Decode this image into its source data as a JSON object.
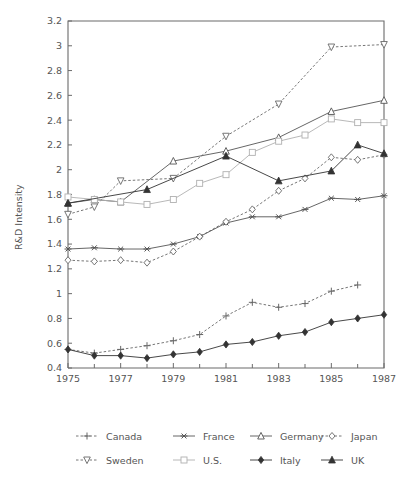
{
  "chart_data": {
    "type": "line",
    "title": "",
    "xlabel": "",
    "ylabel": "R&D Intensity",
    "xlim": [
      1975,
      1987
    ],
    "ylim": [
      0.4,
      3.2
    ],
    "yticks": [
      "0.4",
      "0.6",
      "0.8",
      "1",
      "1.2",
      "1.4",
      "1.6",
      "1.8",
      "2",
      "2.2",
      "2.4",
      "2.6",
      "2.8",
      "3",
      "3.2"
    ],
    "ytick_values": [
      0.4,
      0.6,
      0.8,
      1.0,
      1.2,
      1.4,
      1.6,
      1.8,
      2.0,
      2.2,
      2.4,
      2.6,
      2.8,
      3.0,
      3.2
    ],
    "xticks": [
      "1975",
      "1977",
      "1979",
      "1981",
      "1983",
      "1985",
      "1987"
    ],
    "xtick_values": [
      1975,
      1977,
      1979,
      1981,
      1983,
      1985,
      1987
    ],
    "xminor_values": [
      1976,
      1978,
      1980,
      1982,
      1984,
      1986
    ],
    "grid": false,
    "legend_position": "bottom",
    "x": [
      1975,
      1976,
      1977,
      1978,
      1979,
      1980,
      1981,
      1982,
      1983,
      1984,
      1985,
      1986,
      1987
    ],
    "series": [
      {
        "name": "Canada",
        "marker": "plus",
        "dash": "dashed",
        "color": "#666666",
        "x": [
          1975,
          1976,
          1977,
          1978,
          1979,
          1980,
          1981,
          1982,
          1983,
          1984,
          1985,
          1986
        ],
        "values": [
          0.55,
          0.52,
          0.55,
          0.58,
          0.62,
          0.67,
          0.82,
          0.93,
          0.89,
          0.92,
          1.02,
          1.07
        ]
      },
      {
        "name": "France",
        "marker": "asterisk",
        "dash": "solid",
        "color": "#555555",
        "x": [
          1975,
          1976,
          1977,
          1978,
          1979,
          1980,
          1981,
          1982,
          1983,
          1984,
          1985,
          1986,
          1987
        ],
        "values": [
          1.36,
          1.37,
          1.36,
          1.36,
          1.4,
          1.46,
          1.57,
          1.62,
          1.62,
          1.68,
          1.77,
          1.76,
          1.79
        ]
      },
      {
        "name": "Germany",
        "marker": "triangle-up-open",
        "dash": "solid",
        "color": "#555555",
        "x": [
          1975,
          1976,
          1977,
          1979,
          1981,
          1983,
          1985,
          1987
        ],
        "values": [
          1.73,
          1.76,
          1.74,
          2.07,
          2.15,
          2.26,
          2.47,
          2.56
        ]
      },
      {
        "name": "Japan",
        "marker": "diamond-open",
        "dash": "dashed",
        "color": "#666666",
        "x": [
          1975,
          1976,
          1977,
          1978,
          1979,
          1980,
          1981,
          1982,
          1983,
          1984,
          1985,
          1986,
          1987
        ],
        "values": [
          1.27,
          1.26,
          1.27,
          1.25,
          1.34,
          1.46,
          1.58,
          1.68,
          1.83,
          1.93,
          2.1,
          2.08,
          2.12
        ]
      },
      {
        "name": "Sweden",
        "marker": "triangle-down-open",
        "dash": "dashed",
        "color": "#666666",
        "x": [
          1975,
          1976,
          1977,
          1979,
          1981,
          1983,
          1985,
          1987
        ],
        "values": [
          1.64,
          1.7,
          1.91,
          1.93,
          2.27,
          2.53,
          2.99,
          3.01
        ]
      },
      {
        "name": "U.S.",
        "marker": "square-open",
        "dash": "solid",
        "color": "#b0b0b0",
        "x": [
          1975,
          1976,
          1977,
          1978,
          1979,
          1980,
          1981,
          1982,
          1983,
          1984,
          1985,
          1986,
          1987
        ],
        "values": [
          1.78,
          1.76,
          1.74,
          1.72,
          1.76,
          1.89,
          1.96,
          2.14,
          2.23,
          2.28,
          2.41,
          2.38,
          2.38
        ]
      },
      {
        "name": "Italy",
        "marker": "diamond-filled",
        "dash": "solid",
        "color": "#333333",
        "x": [
          1975,
          1976,
          1977,
          1978,
          1979,
          1980,
          1981,
          1982,
          1983,
          1984,
          1985,
          1986,
          1987
        ],
        "values": [
          0.55,
          0.5,
          0.5,
          0.48,
          0.51,
          0.53,
          0.59,
          0.61,
          0.66,
          0.69,
          0.77,
          0.8,
          0.83
        ]
      },
      {
        "name": "UK",
        "marker": "triangle-up-filled",
        "dash": "solid",
        "color": "#333333",
        "x": [
          1975,
          1978,
          1981,
          1983,
          1985,
          1986,
          1987
        ],
        "values": [
          1.73,
          1.84,
          2.11,
          1.91,
          1.99,
          2.2,
          2.13
        ]
      }
    ]
  },
  "legend": {
    "rows": [
      [
        "Canada",
        "France",
        "Germany",
        "Japan"
      ],
      [
        "Sweden",
        "U.S.",
        "Italy",
        "UK"
      ]
    ]
  }
}
